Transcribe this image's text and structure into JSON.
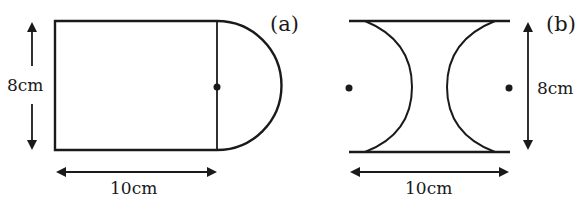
{
  "figures": [
    {
      "id": "a",
      "label": "(a)",
      "shape": "rectangle with semicircle attached on right side",
      "height_label": "8cm",
      "width_label": "10cm",
      "center_dot": "semicircle center on the dividing line"
    },
    {
      "id": "b",
      "label": "(b)",
      "shape": "rectangle with two semicircles removed from left and right sides",
      "height_label": "8cm",
      "width_label": "10cm",
      "center_dots": [
        "left arc center",
        "right arc center"
      ]
    }
  ],
  "colors": {
    "stroke": "#1a1a1a",
    "background": "#ffffff"
  }
}
